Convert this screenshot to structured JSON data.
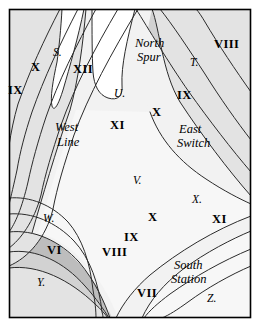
{
  "figure": {
    "kind": "contour-map",
    "border_color": "#000000",
    "background": "#ffffff"
  },
  "palette": {
    "band_0_lightest": "#ffffff",
    "band_1": "#f2f2f2",
    "band_2": "#e3e3e3",
    "band_3": "#d2d2d2",
    "band_4": "#bdbdbd",
    "band_5": "#a8a8a8",
    "band_6_darkest": "#8f8f8f",
    "contour_line": "#2b2b2b"
  },
  "contour_labels": [
    {
      "id": "ix-left",
      "text": "IX",
      "x": 8,
      "y": 84,
      "style": "roman"
    },
    {
      "id": "x-left",
      "text": "X",
      "x": 31,
      "y": 61,
      "style": "roman"
    },
    {
      "id": "xii-top",
      "text": "XII",
      "x": 73,
      "y": 63,
      "style": "roman"
    },
    {
      "id": "xi-mid",
      "text": "XI",
      "x": 110,
      "y": 119,
      "style": "roman"
    },
    {
      "id": "x-upper",
      "text": "X",
      "x": 152,
      "y": 106,
      "style": "roman"
    },
    {
      "id": "ix-upper",
      "text": "IX",
      "x": 177,
      "y": 89,
      "style": "roman"
    },
    {
      "id": "viii-top",
      "text": "VIII",
      "x": 214,
      "y": 38,
      "style": "roman"
    },
    {
      "id": "x-lower",
      "text": "X",
      "x": 148,
      "y": 211,
      "style": "roman"
    },
    {
      "id": "ix-lower",
      "text": "IX",
      "x": 124,
      "y": 231,
      "style": "roman"
    },
    {
      "id": "viii-low",
      "text": "VIII",
      "x": 102,
      "y": 246,
      "style": "roman"
    },
    {
      "id": "vii-low",
      "text": "VII",
      "x": 137,
      "y": 287,
      "style": "roman"
    },
    {
      "id": "vi-left",
      "text": "VI",
      "x": 47,
      "y": 244,
      "style": "roman"
    },
    {
      "id": "xi-right",
      "text": "XI",
      "x": 212,
      "y": 213,
      "style": "roman"
    }
  ],
  "place_labels": [
    {
      "id": "north-spur-1",
      "text": "North",
      "x": 135,
      "y": 37,
      "style": "place"
    },
    {
      "id": "north-spur-2",
      "text": "Spur",
      "x": 137,
      "y": 51,
      "style": "place"
    },
    {
      "id": "west-line-1",
      "text": "West",
      "x": 55,
      "y": 121,
      "style": "place"
    },
    {
      "id": "west-line-2",
      "text": "Line",
      "x": 57,
      "y": 136,
      "style": "place"
    },
    {
      "id": "east-switch-1",
      "text": "East",
      "x": 179,
      "y": 123,
      "style": "place"
    },
    {
      "id": "east-switch-2",
      "text": "Switch",
      "x": 177,
      "y": 137,
      "style": "place"
    },
    {
      "id": "south-station-1",
      "text": "South",
      "x": 174,
      "y": 259,
      "style": "place"
    },
    {
      "id": "south-station-2",
      "text": "Station",
      "x": 171,
      "y": 273,
      "style": "place"
    }
  ],
  "point_labels": [
    {
      "id": "pt-s",
      "text": "S.",
      "x": 53,
      "y": 47,
      "style": "pt"
    },
    {
      "id": "pt-u",
      "text": "U.",
      "x": 114,
      "y": 88,
      "style": "pt"
    },
    {
      "id": "pt-t",
      "text": "T.",
      "x": 190,
      "y": 57,
      "style": "pt"
    },
    {
      "id": "pt-v",
      "text": "V.",
      "x": 133,
      "y": 175,
      "style": "pt"
    },
    {
      "id": "pt-x",
      "text": "X.",
      "x": 192,
      "y": 194,
      "style": "pt"
    },
    {
      "id": "pt-w",
      "text": "W.",
      "x": 43,
      "y": 213,
      "style": "pt"
    },
    {
      "id": "pt-y",
      "text": "Y.",
      "x": 37,
      "y": 277,
      "style": "pt"
    },
    {
      "id": "pt-z",
      "text": "Z.",
      "x": 207,
      "y": 293,
      "style": "pt"
    }
  ]
}
